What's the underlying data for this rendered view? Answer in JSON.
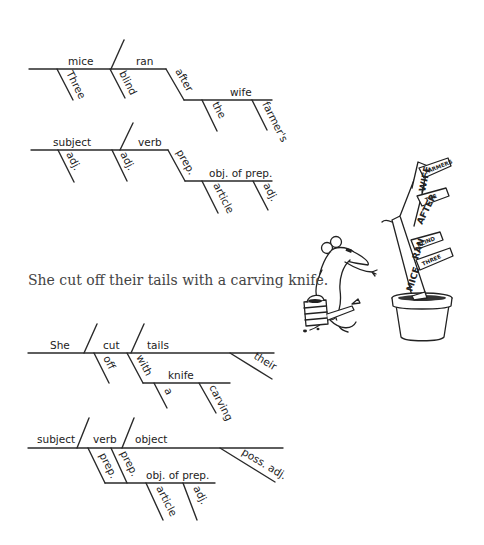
{
  "diagram1": {
    "subject": "mice",
    "verb": "ran",
    "modifiers": [
      "Three",
      "blind"
    ],
    "preposition": "after",
    "object_of_prep": "wife",
    "prep_modifiers": [
      "the",
      "farmer's"
    ]
  },
  "template1": {
    "subject": "subject",
    "verb": "verb",
    "modifiers": [
      "adj.",
      "adj."
    ],
    "preposition": "prep.",
    "object_of_prep": "obj. of prep.",
    "prep_modifiers": [
      "article",
      "adj."
    ]
  },
  "sentence": "She cut off their tails with a carving knife.",
  "diagram2": {
    "subject": "She",
    "verb": "cut",
    "object": "tails",
    "verb_modifier": "off",
    "preposition": "with",
    "object_of_prep": "knife",
    "prep_modifiers": [
      "a",
      "carving"
    ],
    "object_modifier": "their"
  },
  "template2": {
    "subject": "subject",
    "verb": "verb",
    "object": "object",
    "verb_modifier": "prep.",
    "preposition": "prep.",
    "object_of_prep": "obj. of prep.",
    "prep_modifiers": [
      "article",
      "adj."
    ],
    "object_modifier": "poss. adj."
  },
  "illustration": {
    "plant_words": [
      "MICE",
      "RAN",
      "AFTER",
      "WIFE",
      "FARMERS",
      "THE",
      "BLIND",
      "THREE"
    ]
  }
}
